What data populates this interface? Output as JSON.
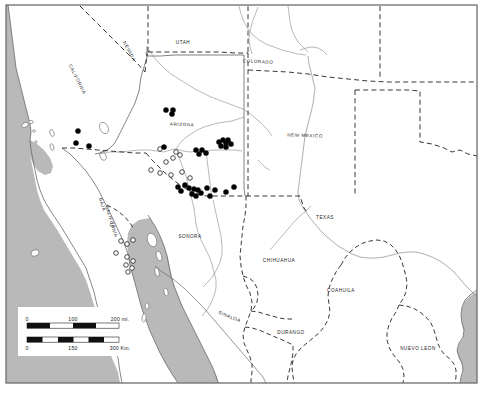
{
  "figure": {
    "type": "distribution-map",
    "region": "Southwestern United States and Northern Mexico",
    "frame_border_color": "#6e6e6e",
    "land_color": "#ffffff",
    "water_color": "#b8b8b8",
    "coastline_color": "#6a6a6a",
    "state_border_color": "#4a4a4a",
    "international_border_color": "#222222",
    "symbol_filled_color": "#000000",
    "symbol_open_color": "#ffffff"
  },
  "labels": {
    "us_states": [
      {
        "name": "NEVADA",
        "x": 128,
        "y": 52,
        "rotate": 62
      },
      {
        "name": "UTAH",
        "x": 183,
        "y": 44,
        "rotate": 0
      },
      {
        "name": "COLORADO",
        "x": 258,
        "y": 63,
        "rotate": 3
      },
      {
        "name": "CALIFORNIA",
        "x": 76,
        "y": 80,
        "rotate": 63
      },
      {
        "name": "ARIZONA",
        "x": 182,
        "y": 126,
        "rotate": 2
      },
      {
        "name": "NEW MEXICO",
        "x": 305,
        "y": 137,
        "rotate": 2
      },
      {
        "name": "TEXAS",
        "x": 325,
        "y": 219,
        "rotate": 0
      }
    ],
    "mexican_states": [
      {
        "name": "BAJA",
        "x": 101,
        "y": 205,
        "rotate": 73
      },
      {
        "name": "CALIFORNIA",
        "x": 110,
        "y": 222,
        "rotate": 73
      },
      {
        "name": "SONORA",
        "x": 190,
        "y": 238,
        "rotate": 0
      },
      {
        "name": "CHIHUAHUA",
        "x": 279,
        "y": 262,
        "rotate": 0
      },
      {
        "name": "COAHUILA",
        "x": 341,
        "y": 292,
        "rotate": 0
      },
      {
        "name": "SINALOA",
        "x": 229,
        "y": 318,
        "rotate": 22
      },
      {
        "name": "DURANGO",
        "x": 291,
        "y": 334,
        "rotate": 0
      },
      {
        "name": "NUEVO LEON",
        "x": 418,
        "y": 350,
        "rotate": 0
      }
    ]
  },
  "scale_bar": {
    "miles": {
      "ticks": [
        "0",
        "100",
        "200 mi."
      ],
      "zero": "0",
      "mid": "100",
      "end": "200 mi."
    },
    "kilometers": {
      "ticks": [
        "0",
        "150",
        "300 Km."
      ],
      "zero": "0",
      "mid": "150",
      "end": "300 Km."
    }
  },
  "symbols": {
    "filled_circles": [
      [
        166,
        110
      ],
      [
        173,
        110
      ],
      [
        172,
        114
      ],
      [
        78,
        131
      ],
      [
        76,
        143
      ],
      [
        89,
        146
      ],
      [
        219,
        142
      ],
      [
        223,
        140
      ],
      [
        226,
        143
      ],
      [
        228,
        140
      ],
      [
        221,
        146
      ],
      [
        226,
        147
      ],
      [
        231,
        144
      ],
      [
        196,
        150
      ],
      [
        199,
        154
      ],
      [
        202,
        150
      ],
      [
        206,
        153
      ],
      [
        185,
        185
      ],
      [
        189,
        188
      ],
      [
        194,
        189
      ],
      [
        198,
        190
      ],
      [
        192,
        194
      ],
      [
        196,
        196
      ],
      [
        201,
        193
      ],
      [
        207,
        188
      ],
      [
        215,
        190
      ],
      [
        226,
        192
      ],
      [
        178,
        187
      ],
      [
        181,
        191
      ],
      [
        210,
        196
      ],
      [
        234,
        187
      ],
      [
        164,
        147
      ]
    ],
    "open_circles": [
      [
        160,
        149
      ],
      [
        176,
        152
      ],
      [
        180,
        155
      ],
      [
        173,
        158
      ],
      [
        166,
        162
      ],
      [
        151,
        170
      ],
      [
        160,
        173
      ],
      [
        171,
        175
      ],
      [
        182,
        172
      ],
      [
        190,
        178
      ],
      [
        127,
        257
      ],
      [
        133,
        261
      ],
      [
        126,
        265
      ],
      [
        132,
        268
      ],
      [
        128,
        272
      ],
      [
        121,
        241
      ],
      [
        127,
        244
      ],
      [
        133,
        240
      ],
      [
        116,
        253
      ]
    ]
  }
}
